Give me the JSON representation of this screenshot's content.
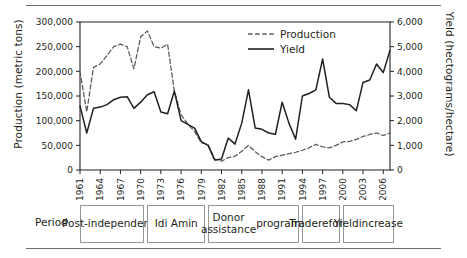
{
  "figure": {
    "period_axis_label": "Period",
    "periods": [
      {
        "label": "Post-\nindependence",
        "start_year": 1961,
        "end_year": 1970
      },
      {
        "label": "Idi Amin",
        "start_year": 1971,
        "end_year": 1979
      },
      {
        "label": "Donor assistance\nprograms",
        "start_year": 1980,
        "end_year": 1993
      },
      {
        "label": "Trade\nreform",
        "start_year": 1994,
        "end_year": 1999
      },
      {
        "label": "Yield\nincrease",
        "start_year": 2000,
        "end_year": 2007
      }
    ]
  },
  "chart_data": {
    "type": "line",
    "title": "",
    "xlabel": "",
    "ylabel": "Production (metric tons)",
    "y2label": "Yield (hectograms/hectare)",
    "xlim": [
      1961,
      2007
    ],
    "ylim": [
      0,
      300000
    ],
    "y2lim": [
      0,
      6000
    ],
    "grid": false,
    "legend_position": "top-right",
    "ytick_labels": [
      "0",
      "50,000",
      "100,000",
      "150,000",
      "200,000",
      "250,000",
      "300,000"
    ],
    "ytick_values": [
      0,
      50000,
      100000,
      150000,
      200000,
      250000,
      300000
    ],
    "y2tick_labels": [
      "0",
      "1,000",
      "2,000",
      "3,000",
      "4,000",
      "5,000",
      "6,000"
    ],
    "y2tick_values": [
      0,
      1000,
      2000,
      3000,
      4000,
      5000,
      6000
    ],
    "xtick_labels": [
      "1961",
      "1964",
      "1967",
      "1970",
      "1973",
      "1976",
      "1979",
      "1982",
      "1985",
      "1988",
      "1991",
      "1994",
      "1997",
      "2000",
      "2003",
      "2006"
    ],
    "xtick_values": [
      1961,
      1964,
      1967,
      1970,
      1973,
      1976,
      1979,
      1982,
      1985,
      1988,
      1991,
      1994,
      1997,
      2000,
      2003,
      2006
    ],
    "x": [
      1961,
      1962,
      1963,
      1964,
      1965,
      1966,
      1967,
      1968,
      1969,
      1970,
      1971,
      1972,
      1973,
      1974,
      1975,
      1976,
      1977,
      1978,
      1979,
      1980,
      1981,
      1982,
      1983,
      1984,
      1985,
      1986,
      1987,
      1988,
      1989,
      1990,
      1991,
      1992,
      1993,
      1994,
      1995,
      1996,
      1997,
      1998,
      1999,
      2000,
      2001,
      2002,
      2003,
      2004,
      2005,
      2006,
      2007
    ],
    "series": [
      {
        "name": "Production",
        "axis": "left",
        "unit": "metric tons",
        "style": "dashed",
        "color": "#58595b",
        "values": [
          200000,
          118000,
          208000,
          215000,
          232000,
          250000,
          255000,
          250000,
          205000,
          270000,
          282000,
          250000,
          247000,
          255000,
          160000,
          112000,
          93000,
          78000,
          55000,
          52000,
          22000,
          18000,
          25000,
          28000,
          38000,
          50000,
          37000,
          27000,
          20000,
          27000,
          30000,
          33000,
          36000,
          40000,
          45000,
          52000,
          47000,
          45000,
          50000,
          57000,
          58000,
          62000,
          68000,
          72000,
          75000,
          70000,
          75000
        ]
      },
      {
        "name": "Yield",
        "axis": "right",
        "unit": "hectograms/hectare",
        "style": "solid",
        "color": "#231f20",
        "values": [
          2600,
          1500,
          2500,
          2550,
          2650,
          2850,
          2950,
          2970,
          2500,
          2750,
          3050,
          3170,
          2350,
          2280,
          3200,
          2000,
          1850,
          1700,
          1150,
          1000,
          400,
          450,
          1300,
          1050,
          1900,
          3250,
          1700,
          1650,
          1500,
          1450,
          2750,
          1900,
          1250,
          3000,
          3100,
          3250,
          4500,
          2950,
          2700,
          2700,
          2650,
          2400,
          3550,
          3650,
          4300,
          3950,
          4850
        ]
      }
    ]
  }
}
